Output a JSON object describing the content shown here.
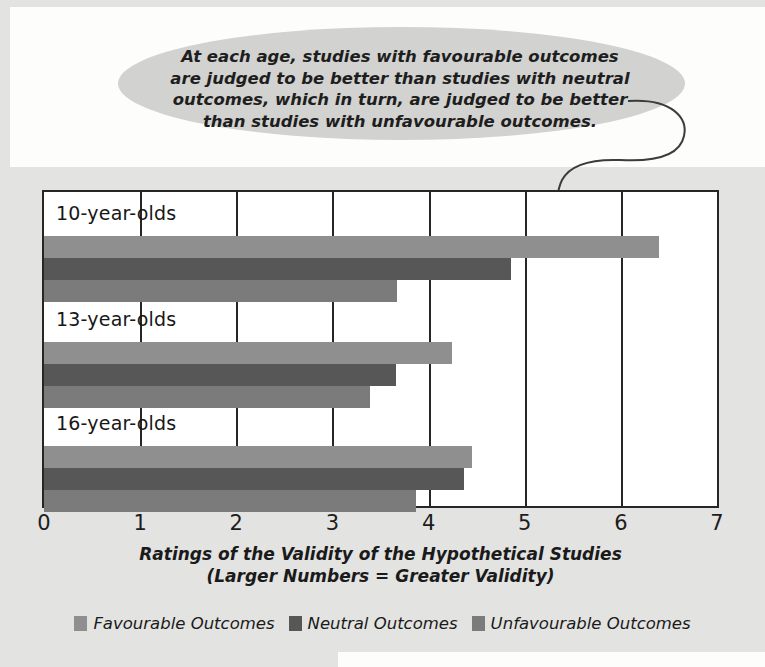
{
  "callout": {
    "text": "At each age, studies with favourable outcomes\nare judged to be better than studies with neutral\noutcomes, which in turn, are judged to be better\nthan studies with unfavourable outcomes.",
    "pointer_icon": "curved-arrow-icon"
  },
  "chart_data": {
    "type": "bar",
    "orientation": "horizontal",
    "title": "",
    "xlabel": "Ratings of the Validity of  the Hypothetical Studies",
    "xlabel_line2": "(Larger Numbers = Greater Validity)",
    "ylabel": "",
    "xlim": [
      0,
      7
    ],
    "xticks": [
      0,
      1,
      2,
      3,
      4,
      5,
      6,
      7
    ],
    "xtick_labels": [
      "0",
      "1",
      "2",
      "3",
      "4",
      "5",
      "6",
      "7"
    ],
    "grid": true,
    "legend_position": "bottom",
    "categories": [
      "10-year-olds",
      "13-year-olds",
      "16-year-olds"
    ],
    "series": [
      {
        "name": "Favourable Outcomes",
        "color": "#8f8f8f",
        "values": [
          6.4,
          4.24,
          4.45
        ]
      },
      {
        "name": "Neutral Outcomes",
        "color": "#575757",
        "values": [
          4.86,
          3.66,
          4.37
        ]
      },
      {
        "name": "Unfavourable Outcomes",
        "color": "#7b7b7b",
        "values": [
          3.67,
          3.39,
          3.87
        ]
      }
    ]
  }
}
